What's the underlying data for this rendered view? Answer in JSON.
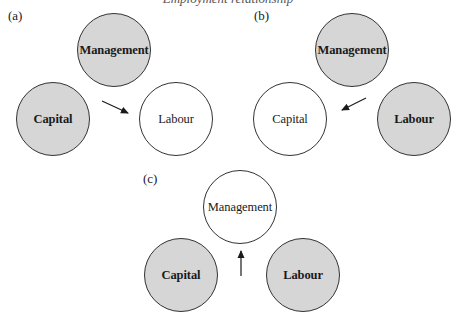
{
  "top_caption": "Employment relationship",
  "panels": [
    {
      "label": "(a)",
      "nodes": [
        {
          "text": "Management",
          "shaded": true
        },
        {
          "text": "Capital",
          "shaded": true
        },
        {
          "text": "Labour",
          "shaded": false
        }
      ],
      "arrow": {
        "direction": "toward Labour"
      }
    },
    {
      "label": "(b)",
      "nodes": [
        {
          "text": "Management",
          "shaded": true
        },
        {
          "text": "Capital",
          "shaded": false
        },
        {
          "text": "Labour",
          "shaded": true
        }
      ],
      "arrow": {
        "direction": "toward Capital"
      }
    },
    {
      "label": "(c)",
      "nodes": [
        {
          "text": "Management",
          "shaded": false
        },
        {
          "text": "Capital",
          "shaded": true
        },
        {
          "text": "Labour",
          "shaded": true
        }
      ],
      "arrow": {
        "direction": "toward Management"
      }
    }
  ],
  "colors": {
    "shaded_fill": "#d6d6d6",
    "open_fill": "#ffffff",
    "stroke": "#333333"
  }
}
